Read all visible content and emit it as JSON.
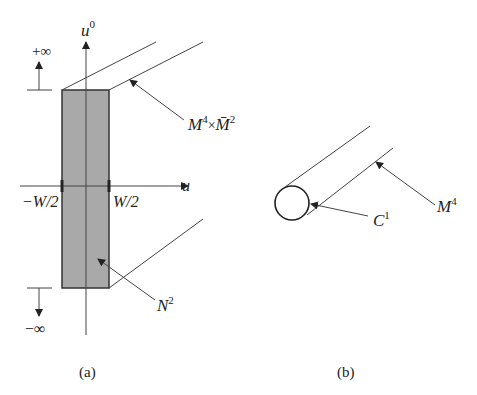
{
  "panel_a": {
    "axis_vertical_label": "u",
    "axis_vertical_sup": "0",
    "axis_horizontal_label": "u",
    "plus_infinity": "+∞",
    "minus_infinity": "−∞",
    "left_bound": "−W/2",
    "right_bound": "W/2",
    "label_product_M": "M",
    "label_product_M_sup": "4",
    "label_product_times": "×",
    "label_product_Mbar": "M̄",
    "label_product_Mbar_sup": "2",
    "label_N": "N",
    "label_N_sup": "2",
    "caption": "(a)"
  },
  "panel_b": {
    "label_C": "C",
    "label_C_sup": "1",
    "label_M": "M",
    "label_M_sup": "4",
    "caption": "(b)"
  },
  "colors": {
    "strip_fill": "#a9a9a9",
    "line": "#333333"
  }
}
